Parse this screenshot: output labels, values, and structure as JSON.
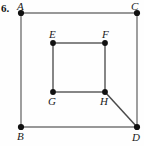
{
  "figure": {
    "problem_number": "6.",
    "type": "geometry-diagram",
    "vertex_labels": {
      "A": "A",
      "B": "B",
      "C": "C",
      "D": "D",
      "E": "E",
      "F": "F",
      "G": "G",
      "H": "H"
    },
    "colors": {
      "outline": "#767676",
      "inner_outline": "#5e5e5e",
      "diagonal": "#4a4a4a",
      "vertex_dot": "#111111",
      "text": "#1a1a1a",
      "background": "#fefefe"
    },
    "points": {
      "A": {
        "x": 21,
        "y": 13
      },
      "C": {
        "x": 137,
        "y": 13
      },
      "B": {
        "x": 21,
        "y": 127
      },
      "D": {
        "x": 137,
        "y": 127
      },
      "E": {
        "x": 53,
        "y": 43
      },
      "F": {
        "x": 105,
        "y": 43
      },
      "G": {
        "x": 53,
        "y": 92
      },
      "H": {
        "x": 105,
        "y": 92
      }
    },
    "segments": [
      {
        "name": "A-C",
        "from": "A",
        "to": "C"
      },
      {
        "name": "A-B",
        "from": "A",
        "to": "B"
      },
      {
        "name": "C-D",
        "from": "C",
        "to": "D"
      },
      {
        "name": "B-D",
        "from": "B",
        "to": "D"
      },
      {
        "name": "E-F",
        "from": "E",
        "to": "F"
      },
      {
        "name": "E-G",
        "from": "E",
        "to": "G"
      },
      {
        "name": "F-H",
        "from": "F",
        "to": "H"
      },
      {
        "name": "G-H",
        "from": "G",
        "to": "H"
      },
      {
        "name": "H-D",
        "from": "H",
        "to": "D"
      }
    ]
  }
}
